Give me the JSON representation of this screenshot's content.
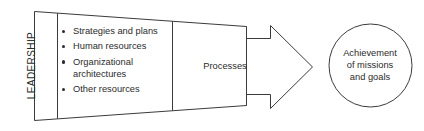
{
  "diagram": {
    "type": "process-flow",
    "background_color": "#ffffff",
    "stroke_color": "#3b3b3b",
    "text_color": "#2b2b2b",
    "leadership_band": {
      "label": "LEADERSHIP",
      "orientation": "vertical-bottom-to-top"
    },
    "inputs_panel": {
      "bullets": [
        "Strategies and plans",
        "Human resources",
        "Organizational architectures",
        "Other resources"
      ]
    },
    "arrow": {
      "label": "Processes",
      "direction": "right"
    },
    "outcome_circle": {
      "label": "Achievement of missions and goals",
      "line1": "Achievement",
      "line2": "of missions",
      "line3": "and goals"
    }
  }
}
